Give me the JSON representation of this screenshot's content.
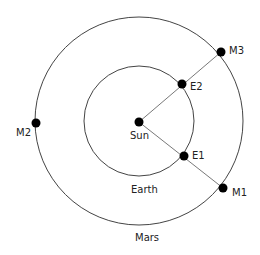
{
  "diagram": {
    "colors": {
      "line": "#444444",
      "dot": "#000000",
      "text": "#222222"
    },
    "sun": {
      "label": "Sun",
      "x": 139,
      "y": 122
    },
    "orbits": {
      "earth": {
        "label": "Earth",
        "r": 55
      },
      "mars": {
        "label": "Mars",
        "r": 104
      }
    },
    "points": {
      "E1": {
        "label": "E1",
        "x": 184,
        "y": 156
      },
      "E2": {
        "label": "E2",
        "x": 182,
        "y": 84
      },
      "M1": {
        "label": "M1",
        "x": 223,
        "y": 188
      },
      "M2": {
        "label": "M2",
        "x": 36,
        "y": 123
      },
      "M3": {
        "label": "M3",
        "x": 221,
        "y": 52
      }
    }
  }
}
